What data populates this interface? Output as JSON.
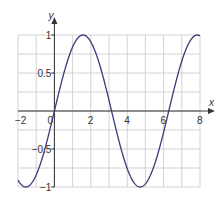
{
  "chart_data": {
    "type": "line",
    "title": "",
    "xlabel": "x",
    "ylabel": "y",
    "xlim": [
      -2,
      8
    ],
    "ylim": [
      -1,
      1
    ],
    "grid": true,
    "x_ticks": [
      -2,
      0,
      2,
      4,
      6,
      8
    ],
    "x_tick_labels": [
      "−2",
      "0",
      "2",
      "4",
      "6",
      "8"
    ],
    "y_ticks": [
      1,
      0.5,
      -0.5,
      -1
    ],
    "y_tick_labels": [
      "1",
      "0.5",
      "−0.5",
      "−1"
    ],
    "series": [
      {
        "name": "y = sin(x)",
        "function": "sin(x)",
        "color": "#3a3a7a",
        "x": [
          -2,
          -1.5708,
          -1,
          0,
          1,
          1.5708,
          2,
          3,
          3.1416,
          4,
          4.7124,
          5,
          6,
          6.2832,
          7,
          7.854,
          8
        ],
        "y": [
          -0.909,
          -1,
          -0.841,
          0,
          0.841,
          1,
          0.909,
          0.141,
          0,
          -0.757,
          -1,
          -0.959,
          -0.279,
          0,
          0.657,
          1,
          0.989
        ]
      }
    ]
  },
  "colors": {
    "grid": "#c8c8c8",
    "axis": "#333333",
    "curve": "#3a3a7a"
  }
}
